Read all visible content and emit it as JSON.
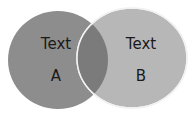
{
  "diagram": {
    "type": "venn",
    "circles": [
      {
        "id": "A",
        "title": "Text",
        "label": "A",
        "color": "#8c8c8c"
      },
      {
        "id": "B",
        "title": "Text",
        "label": "B",
        "color": "#b5b5b5"
      }
    ],
    "overlap_color": "#7a7a7a",
    "outline_color": "#f0f0f0"
  }
}
